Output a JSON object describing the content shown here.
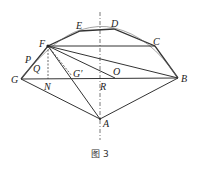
{
  "figure": {
    "caption": "图 3",
    "labels": {
      "E": "E",
      "D": "D",
      "F": "F",
      "C": "C",
      "P": "P",
      "Q": "Q",
      "G": "G",
      "N": "N",
      "G_prime": "G′",
      "O": "O",
      "R": "R",
      "B": "B",
      "A": "A"
    },
    "points": {
      "F": [
        48,
        46
      ],
      "E": [
        80,
        31
      ],
      "D": [
        114,
        29
      ],
      "C": [
        155,
        46
      ],
      "B": [
        178,
        78
      ],
      "G": [
        21,
        79
      ],
      "A": [
        100,
        119
      ],
      "N": [
        48,
        79
      ],
      "R": [
        100,
        79
      ],
      "O": [
        115,
        78
      ],
      "G_prime": [
        72,
        76
      ]
    },
    "colors": {
      "stroke": "#333333",
      "axis": "#555555"
    }
  }
}
